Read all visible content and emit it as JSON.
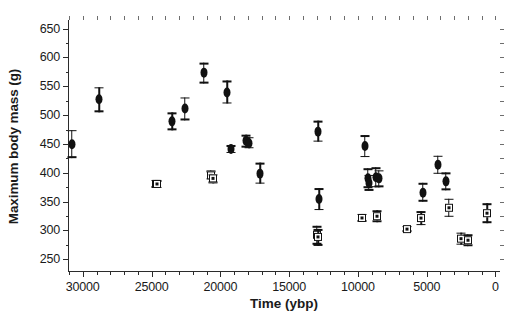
{
  "chart_data": {
    "type": "scatter",
    "title": "",
    "xlabel": "Time (ybp)",
    "ylabel": "Maximum body mass (g)",
    "xlim": [
      31000,
      -400
    ],
    "ylim": [
      228,
      665
    ],
    "x_reversed": true,
    "grid": false,
    "legend": "none",
    "x_ticks": [
      30000,
      25000,
      20000,
      15000,
      10000,
      5000,
      0
    ],
    "x_tick_labels": [
      "30000",
      "25000",
      "20000",
      "15000",
      "10000",
      "5000",
      "0"
    ],
    "x_minor_step": 1000,
    "y_ticks": [
      250,
      300,
      350,
      400,
      450,
      500,
      550,
      600,
      650
    ],
    "y_tick_labels": [
      "250",
      "300",
      "350",
      "400",
      "450",
      "500",
      "550",
      "600",
      "650"
    ],
    "y_minor_step": 25,
    "error_bar_style": "vertical-with-caps",
    "series": [
      {
        "name": "large-bodied (filled circle)",
        "marker": "circle",
        "points": [
          {
            "x": 28800,
            "y": 527,
            "yerr": 22
          },
          {
            "x": 30800,
            "y": 450,
            "yerr": 24
          },
          {
            "x": 23500,
            "y": 489,
            "yerr": 15
          },
          {
            "x": 22600,
            "y": 511,
            "yerr": 20
          },
          {
            "x": 21200,
            "y": 573,
            "yerr": 18
          },
          {
            "x": 19500,
            "y": 540,
            "yerr": 20
          },
          {
            "x": 19200,
            "y": 441,
            "yerr": 7
          },
          {
            "x": 18100,
            "y": 455,
            "yerr": 11
          },
          {
            "x": 17900,
            "y": 452,
            "yerr": 10
          },
          {
            "x": 17100,
            "y": 399,
            "yerr": 18
          },
          {
            "x": 12900,
            "y": 472,
            "yerr": 18
          },
          {
            "x": 12800,
            "y": 354,
            "yerr": 19
          },
          {
            "x": 9500,
            "y": 446,
            "yerr": 19
          },
          {
            "x": 9300,
            "y": 391,
            "yerr": 17
          },
          {
            "x": 9200,
            "y": 383,
            "yerr": 14
          },
          {
            "x": 8700,
            "y": 392,
            "yerr": 17
          },
          {
            "x": 8500,
            "y": 390,
            "yerr": 15
          },
          {
            "x": 5300,
            "y": 366,
            "yerr": 16
          },
          {
            "x": 4200,
            "y": 414,
            "yerr": 16
          },
          {
            "x": 3600,
            "y": 385,
            "yerr": 15
          }
        ]
      },
      {
        "name": "small-bodied (open square)",
        "marker": "square",
        "points": [
          {
            "x": 24700,
            "y": 381,
            "yerr": 7
          },
          {
            "x": 24600,
            "y": 380,
            "yerr": 7
          },
          {
            "x": 20700,
            "y": 396,
            "yerr": 8
          },
          {
            "x": 20500,
            "y": 390,
            "yerr": 8
          },
          {
            "x": 13000,
            "y": 292,
            "yerr": 16
          },
          {
            "x": 12900,
            "y": 288,
            "yerr": 14
          },
          {
            "x": 9700,
            "y": 322,
            "yerr": 7
          },
          {
            "x": 8600,
            "y": 325,
            "yerr": 10
          },
          {
            "x": 6400,
            "y": 303,
            "yerr": 5
          },
          {
            "x": 5400,
            "y": 321,
            "yerr": 12
          },
          {
            "x": 3400,
            "y": 339,
            "yerr": 16
          },
          {
            "x": 2500,
            "y": 286,
            "yerr": 11
          },
          {
            "x": 2000,
            "y": 283,
            "yerr": 10
          },
          {
            "x": 600,
            "y": 330,
            "yerr": 17
          }
        ]
      }
    ]
  }
}
